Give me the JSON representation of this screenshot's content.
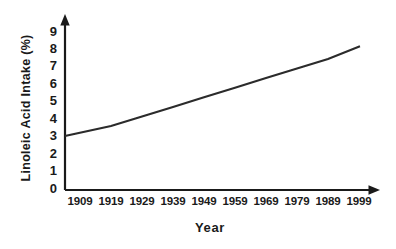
{
  "chart_data": {
    "type": "line",
    "title": "",
    "subtitle": "",
    "xlabel": "Year",
    "ylabel": "Linoleic Acid Intake (%)",
    "x": [
      1909,
      1919,
      1929,
      1939,
      1949,
      1959,
      1969,
      1979,
      1989,
      1999
    ],
    "categories": [
      "1909",
      "1919",
      "1929",
      "1939",
      "1949",
      "1959",
      "1969",
      "1979",
      "1989",
      "1999"
    ],
    "values": [
      3.0,
      3.55,
      4.1,
      4.65,
      5.2,
      5.75,
      6.3,
      6.85,
      7.4,
      8.1
    ],
    "series": [
      {
        "name": "Linoleic Acid Intake",
        "values": [
          3.0,
          3.55,
          4.1,
          4.65,
          5.2,
          5.75,
          6.3,
          6.85,
          7.4,
          8.1
        ],
        "color": "#2b2b2b"
      }
    ],
    "ylim": [
      0,
      9
    ],
    "xlim": [
      1909,
      1999
    ],
    "yticks": [
      "0",
      "1",
      "2",
      "3",
      "4",
      "5",
      "6",
      "7",
      "8",
      "9"
    ],
    "ytick_values": [
      0,
      1,
      2,
      3,
      4,
      5,
      6,
      7,
      8,
      9
    ],
    "xticks": [
      "1909",
      "1919",
      "1929",
      "1939",
      "1949",
      "1959",
      "1969",
      "1979",
      "1989",
      "1999"
    ],
    "grid": false,
    "legend": "none",
    "tick_marks": false,
    "axis_arrows": true,
    "background_color": "#ffffff",
    "axis_color": "#1a1a1a",
    "line_color": "#2b2b2b",
    "annotations": []
  }
}
